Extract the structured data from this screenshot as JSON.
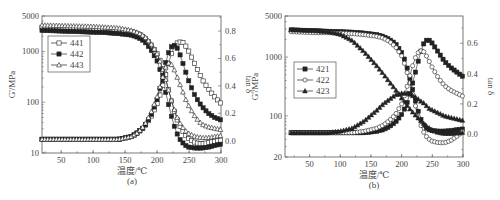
{
  "chart_data": [
    {
      "type": "scatter",
      "panel_label": "(a)",
      "xlabel": "温度/℃",
      "ylabel": "G'/MPa",
      "ylabel_right": "tan δ",
      "xlim": [
        20,
        300
      ],
      "xticks": [
        50,
        100,
        150,
        200,
        250,
        300
      ],
      "ylim": [
        10,
        5000
      ],
      "yscale": "log",
      "yticks": [
        10,
        100,
        1000,
        5000
      ],
      "ylim_right": [
        -0.09,
        0.91
      ],
      "yticks_right": [
        0.0,
        0.2,
        0.4,
        0.6,
        0.8
      ],
      "legend": {
        "position": "upper left",
        "entries": [
          "441",
          "442",
          "443"
        ]
      },
      "x": [
        20,
        40,
        60,
        80,
        100,
        120,
        140,
        160,
        170,
        180,
        190,
        200,
        205,
        210,
        215,
        220,
        225,
        230,
        235,
        240,
        245,
        250,
        260,
        270,
        280,
        290,
        300
      ],
      "series": [
        {
          "name": "441",
          "marker": "open-square",
          "quantity": "G'",
          "values": [
            3000,
            2950,
            2900,
            2850,
            2800,
            2750,
            2650,
            2450,
            2250,
            1900,
            1400,
            900,
            650,
            420,
            250,
            140,
            80,
            50,
            35,
            27,
            22,
            19,
            16,
            15,
            16,
            17,
            18
          ]
        },
        {
          "name": "442",
          "marker": "filled-square",
          "quantity": "G'",
          "values": [
            2600,
            2550,
            2500,
            2450,
            2400,
            2350,
            2250,
            2100,
            1900,
            1600,
            1100,
            650,
            420,
            240,
            130,
            70,
            40,
            26,
            19,
            16,
            14,
            13,
            12.5,
            12.5,
            13,
            14,
            15
          ]
        },
        {
          "name": "443",
          "marker": "open-triangle",
          "quantity": "G'",
          "values": [
            3300,
            3250,
            3200,
            3150,
            3100,
            3000,
            2900,
            2600,
            2350,
            2000,
            1450,
            900,
            620,
            400,
            240,
            140,
            85,
            55,
            40,
            32,
            27,
            24,
            21,
            20,
            20,
            21,
            22
          ]
        },
        {
          "name": "441",
          "marker": "open-square",
          "quantity": "tan δ",
          "values": [
            0.01,
            0.01,
            0.01,
            0.01,
            0.01,
            0.01,
            0.01,
            0.03,
            0.06,
            0.1,
            0.17,
            0.27,
            0.34,
            0.42,
            0.51,
            0.6,
            0.67,
            0.71,
            0.72,
            0.72,
            0.69,
            0.65,
            0.55,
            0.45,
            0.38,
            0.32,
            0.27
          ]
        },
        {
          "name": "442",
          "marker": "filled-square",
          "quantity": "tan δ",
          "values": [
            0.01,
            0.01,
            0.01,
            0.01,
            0.01,
            0.01,
            0.01,
            0.03,
            0.06,
            0.1,
            0.18,
            0.3,
            0.39,
            0.5,
            0.6,
            0.67,
            0.7,
            0.69,
            0.64,
            0.57,
            0.5,
            0.43,
            0.32,
            0.25,
            0.2,
            0.17,
            0.15
          ]
        },
        {
          "name": "443",
          "marker": "open-triangle",
          "quantity": "tan δ",
          "values": [
            0.01,
            0.01,
            0.01,
            0.01,
            0.01,
            0.01,
            0.01,
            0.03,
            0.06,
            0.11,
            0.2,
            0.32,
            0.4,
            0.48,
            0.56,
            0.57,
            0.54,
            0.48,
            0.42,
            0.36,
            0.3,
            0.25,
            0.17,
            0.12,
            0.1,
            0.09,
            0.08
          ]
        }
      ]
    },
    {
      "type": "scatter",
      "panel_label": "(b)",
      "xlabel": "温度/℃",
      "ylabel": "G'/MPa",
      "ylabel_right": "tan δ",
      "xlim": [
        10,
        300
      ],
      "xticks": [
        50,
        100,
        150,
        200,
        250,
        300
      ],
      "ylim": [
        20,
        5000
      ],
      "yscale": "log",
      "yticks": [
        20,
        100,
        1000,
        5000
      ],
      "ylim_right": [
        -0.15,
        0.78
      ],
      "yticks_right": [
        0.0,
        0.2,
        0.4,
        0.6
      ],
      "legend": {
        "position": "center left",
        "entries": [
          "421",
          "422",
          "423"
        ]
      },
      "x": [
        20,
        40,
        60,
        80,
        100,
        120,
        140,
        160,
        170,
        180,
        190,
        200,
        205,
        210,
        215,
        220,
        225,
        230,
        235,
        240,
        245,
        250,
        260,
        270,
        280,
        290,
        300
      ],
      "series": [
        {
          "name": "421",
          "marker": "filled-square",
          "quantity": "G'",
          "values": [
            2900,
            2850,
            2800,
            2750,
            2700,
            2650,
            2550,
            2400,
            2250,
            2000,
            1700,
            1200,
            900,
            600,
            380,
            230,
            140,
            95,
            72,
            62,
            58,
            56,
            55,
            55,
            56,
            58,
            60
          ]
        },
        {
          "name": "422",
          "marker": "open-circle",
          "quantity": "G'",
          "values": [
            2700,
            2650,
            2600,
            2600,
            2550,
            2500,
            2400,
            2250,
            2100,
            1850,
            1500,
            1050,
            760,
            500,
            320,
            190,
            115,
            75,
            55,
            45,
            40,
            37,
            35,
            35,
            38,
            45,
            55
          ]
        },
        {
          "name": "423",
          "marker": "filled-triangle",
          "quantity": "G'",
          "values": [
            2900,
            2850,
            2800,
            2700,
            2450,
            1900,
            1200,
            700,
            520,
            380,
            280,
            200,
            170,
            145,
            125,
            110,
            97,
            85,
            76,
            68,
            62,
            57,
            52,
            50,
            50,
            51,
            52
          ]
        },
        {
          "name": "421",
          "marker": "filled-square",
          "quantity": "tan δ",
          "values": [
            0.01,
            0.01,
            0.01,
            0.01,
            0.01,
            0.01,
            0.01,
            0.02,
            0.03,
            0.05,
            0.08,
            0.13,
            0.17,
            0.22,
            0.29,
            0.37,
            0.45,
            0.53,
            0.59,
            0.62,
            0.62,
            0.6,
            0.54,
            0.48,
            0.44,
            0.41,
            0.38
          ]
        },
        {
          "name": "422",
          "marker": "open-circle",
          "quantity": "tan δ",
          "values": [
            0.01,
            0.01,
            0.01,
            0.01,
            0.01,
            0.01,
            0.02,
            0.04,
            0.06,
            0.09,
            0.13,
            0.2,
            0.26,
            0.33,
            0.41,
            0.48,
            0.53,
            0.55,
            0.55,
            0.52,
            0.48,
            0.44,
            0.37,
            0.32,
            0.29,
            0.27,
            0.25
          ]
        },
        {
          "name": "423",
          "marker": "filled-triangle",
          "quantity": "tan δ",
          "values": [
            0.01,
            0.01,
            0.01,
            0.01,
            0.02,
            0.04,
            0.09,
            0.16,
            0.2,
            0.23,
            0.26,
            0.27,
            0.27,
            0.27,
            0.26,
            0.25,
            0.24,
            0.22,
            0.21,
            0.19,
            0.17,
            0.16,
            0.14,
            0.12,
            0.11,
            0.1,
            0.09
          ]
        }
      ]
    }
  ]
}
